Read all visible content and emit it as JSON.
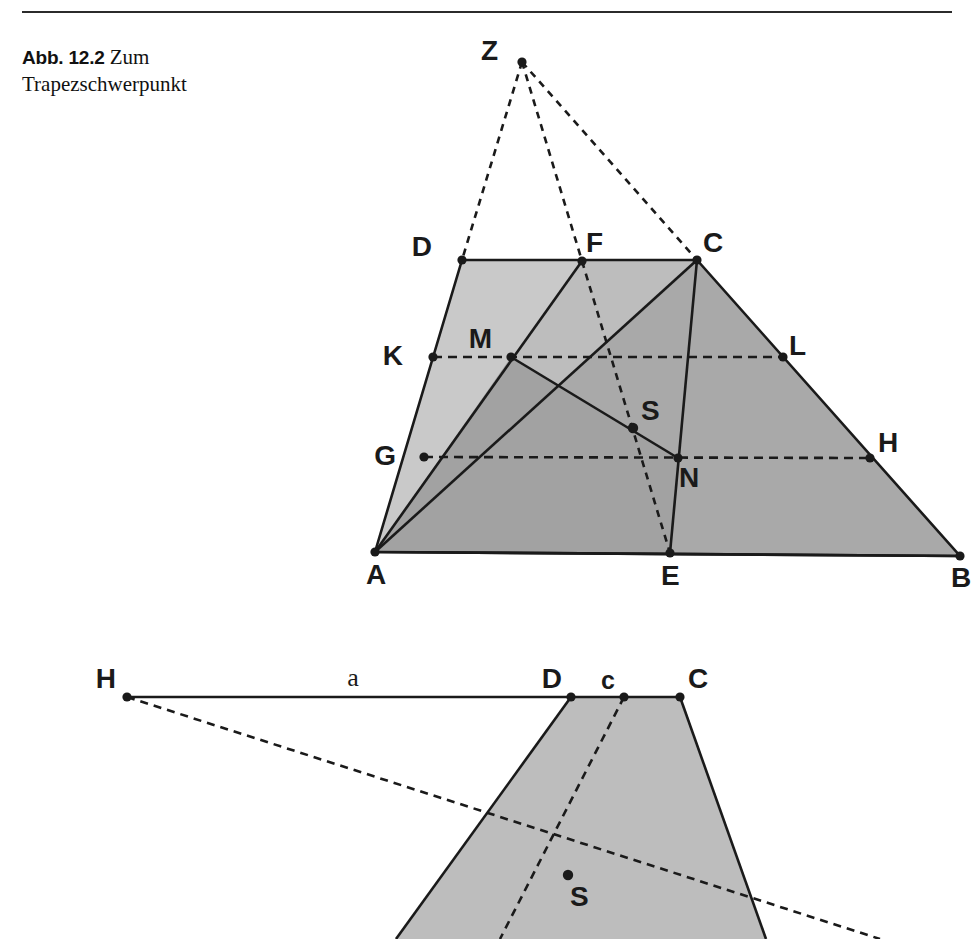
{
  "figure": {
    "caption_label": "Abb. 12.2",
    "caption_text": "Zum Trapezschwerpunkt",
    "colors": {
      "stroke": "#1a1a1a",
      "fill_light": "#c8c8c8",
      "fill_mid": "#b0b0b0",
      "fill_dark": "#a5a5a5",
      "background": "#ffffff",
      "rule": "#2b2b2b"
    }
  },
  "top_figure": {
    "name": "trapezoid-centroid-construction",
    "points": [
      {
        "id": "Z",
        "label": "Z",
        "x": 522,
        "y": 62,
        "lx": 498,
        "ly": 60,
        "dot": true
      },
      {
        "id": "D",
        "label": "D",
        "x": 462,
        "y": 260,
        "lx": 432,
        "ly": 256,
        "dot": true
      },
      {
        "id": "F",
        "label": "F",
        "x": 582,
        "y": 261,
        "lx": 586,
        "ly": 252,
        "dot": true
      },
      {
        "id": "C",
        "label": "C",
        "x": 697,
        "y": 260,
        "lx": 703,
        "ly": 252,
        "dot": true
      },
      {
        "id": "K",
        "label": "K",
        "x": 433,
        "y": 357,
        "lx": 403,
        "ly": 355,
        "dot": true
      },
      {
        "id": "M",
        "label": "M",
        "x": 511,
        "y": 357,
        "lx": 492,
        "ly": 344,
        "dot": true
      },
      {
        "id": "L",
        "label": "L",
        "x": 783,
        "y": 357,
        "lx": 789,
        "ly": 350,
        "dot": true
      },
      {
        "id": "S",
        "label": "S",
        "x": 633,
        "y": 428,
        "lx": 641,
        "ly": 417,
        "dot": true
      },
      {
        "id": "G",
        "label": "G",
        "x": 424,
        "y": 457,
        "lx": 392,
        "ly": 455,
        "dot": true
      },
      {
        "id": "N",
        "label": "N",
        "x": 678,
        "y": 458,
        "lx": 679,
        "ly": 484,
        "dot": true
      },
      {
        "id": "H",
        "label": "H",
        "x": 870,
        "y": 458,
        "lx": 878,
        "ly": 452,
        "dot": true
      },
      {
        "id": "A",
        "label": "A",
        "x": 375,
        "y": 552,
        "lx": 366,
        "ly": 581,
        "dot": true
      },
      {
        "id": "E",
        "label": "E",
        "x": 670,
        "y": 553,
        "lx": 661,
        "ly": 582,
        "dot": true
      },
      {
        "id": "B",
        "label": "B",
        "x": 960,
        "y": 556,
        "lx": 951,
        "ly": 584,
        "dot": true
      }
    ],
    "solid_lines": [
      {
        "name": "side-DA",
        "from": "D",
        "to": "A"
      },
      {
        "name": "top-DC",
        "from": "D",
        "to": "C"
      },
      {
        "name": "side-CB",
        "from": "C",
        "to": "B"
      },
      {
        "name": "base-AB",
        "from": "A",
        "to": "B"
      },
      {
        "name": "diagonal-AC",
        "from": "A",
        "to": "C"
      },
      {
        "name": "segment-AF",
        "from": "A",
        "to": "F"
      },
      {
        "name": "segment-CE",
        "from": "C",
        "to": "E"
      },
      {
        "name": "median-MN",
        "from": "M",
        "to": "N"
      }
    ],
    "dashed_lines": [
      {
        "name": "ray-ZD",
        "from": "Z",
        "to": "D"
      },
      {
        "name": "ray-ZF-E",
        "from": "Z",
        "to": "E"
      },
      {
        "name": "ray-ZC",
        "from": "Z",
        "to": "C"
      },
      {
        "name": "midline-KL",
        "from": "K",
        "to": "L"
      },
      {
        "name": "midline-GH",
        "from": "G",
        "to": "H"
      }
    ]
  },
  "bottom_figure": {
    "name": "trapezoid-centroid-shift",
    "points": [
      {
        "id": "H2",
        "label": "H",
        "x": 127,
        "y": 697,
        "lx": 116,
        "ly": 687,
        "dot": true
      },
      {
        "id": "D2",
        "label": "D",
        "x": 571,
        "y": 697,
        "lx": 557,
        "ly": 687,
        "dot": true
      },
      {
        "id": "c2",
        "label": "c",
        "x": 624,
        "y": 697,
        "lx": 615,
        "ly": 688,
        "dot": true
      },
      {
        "id": "C2",
        "label": "C",
        "x": 680,
        "y": 697,
        "lx": 688,
        "ly": 687,
        "dot": true
      },
      {
        "id": "S2",
        "label": "S",
        "x": 568,
        "y": 875,
        "lx": 570,
        "ly": 904,
        "dot": true
      }
    ],
    "segment_label": {
      "text": "a",
      "x": 353,
      "y": 684
    },
    "solid_lines": [
      {
        "name": "top-HC",
        "from": "H2",
        "to": "C2"
      },
      {
        "name": "left-side-D",
        "from": "D2",
        "to": "P_left_bottom"
      },
      {
        "name": "right-side-C",
        "from": "C2",
        "to": "P_right_bottom"
      }
    ],
    "dashed_lines": [
      {
        "name": "ray-H-to-S",
        "from": "H2",
        "to": "S2"
      },
      {
        "name": "ray-c-to-S",
        "from": "c2",
        "to": "S2"
      }
    ],
    "polygon_outline": [
      {
        "x": 571,
        "y": 697
      },
      {
        "x": 680,
        "y": 697
      },
      {
        "x": 762,
        "y": 939
      },
      {
        "x": 400,
        "y": 939
      }
    ]
  }
}
